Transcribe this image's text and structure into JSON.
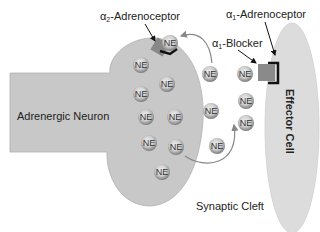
{
  "labels": {
    "alpha2_prefix": "α",
    "alpha2_sub": "2",
    "alpha2_rest": "-Adrenoceptor",
    "alpha1_prefix": "α",
    "alpha1_sub": "1",
    "alpha1_rest": "-Adrenoceptor",
    "blocker_prefix": "α",
    "blocker_sub": "1",
    "blocker_rest": "-Blocker",
    "neuron": "Adrenergic Neuron",
    "effector": "Effector Cell",
    "cleft": "Synaptic Cleft"
  },
  "ne_label": "NE",
  "colors": {
    "neuron_fill": "#c8c8c8",
    "effector_fill": "#dcdcdc",
    "receptor_alpha2": "#888888",
    "receptor_alpha1": "#8a8a8a",
    "arrow": "#888888",
    "text": "#222222"
  },
  "molecules": [
    {
      "x": 170,
      "y": 43,
      "zone": "alpha2-bound"
    },
    {
      "x": 141,
      "y": 65,
      "zone": "neuron"
    },
    {
      "x": 167,
      "y": 84,
      "zone": "neuron"
    },
    {
      "x": 141,
      "y": 94,
      "zone": "neuron"
    },
    {
      "x": 144,
      "y": 117,
      "zone": "neuron"
    },
    {
      "x": 174,
      "y": 117,
      "zone": "neuron"
    },
    {
      "x": 147,
      "y": 143,
      "zone": "neuron"
    },
    {
      "x": 175,
      "y": 147,
      "zone": "neuron"
    },
    {
      "x": 163,
      "y": 171,
      "zone": "neuron"
    },
    {
      "x": 210,
      "y": 74,
      "zone": "cleft"
    },
    {
      "x": 245,
      "y": 74,
      "zone": "cleft"
    },
    {
      "x": 211,
      "y": 111,
      "zone": "cleft"
    },
    {
      "x": 246,
      "y": 101,
      "zone": "cleft"
    },
    {
      "x": 246,
      "y": 123,
      "zone": "cleft"
    },
    {
      "x": 218,
      "y": 145,
      "zone": "cleft"
    }
  ]
}
